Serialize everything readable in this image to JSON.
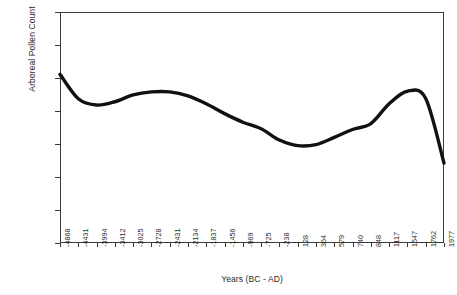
{
  "chart_data": {
    "type": "line",
    "title": "",
    "xlabel": "Years (BC - AD)",
    "ylabel": "Arboreal Pollen Count",
    "ylim": [
      0,
      3500
    ],
    "yticks": [
      0,
      500,
      1000,
      1500,
      2000,
      2500,
      3000,
      3500
    ],
    "grid": false,
    "legend": "none",
    "categories": [
      "-4868",
      "-4431",
      "-3994",
      "-3412",
      "-3025",
      "-2728",
      "-2431",
      "-2134",
      "-1837",
      "-1456",
      "-969",
      "-725",
      "-238",
      "128",
      "364",
      "579",
      "740",
      "848",
      "1117",
      "1547",
      "1762",
      "1977"
    ],
    "values": [
      2555,
      2185,
      2090,
      2140,
      2245,
      2290,
      2290,
      2230,
      2110,
      1960,
      1830,
      1730,
      1560,
      1475,
      1490,
      1600,
      1720,
      1810,
      2110,
      2300,
      2190,
      1210
    ],
    "series": [
      {
        "name": "Arboreal Pollen Count",
        "values": [
          2555,
          2185,
          2090,
          2140,
          2245,
          2290,
          2290,
          2230,
          2110,
          1960,
          1830,
          1730,
          1560,
          1475,
          1490,
          1600,
          1720,
          1810,
          2110,
          2300,
          2190,
          1210
        ],
        "color": "#111111",
        "line_width": 3.4,
        "markers": false,
        "smooth": true
      }
    ]
  },
  "axes": {
    "y_title": "Arboreal Pollen Count",
    "x_title": "Years (BC - AD)",
    "y_tick_labels": [
      "3500",
      "3000",
      "2500",
      "2000",
      "1500",
      "1000",
      "500",
      "0"
    ],
    "x_tick_labels": [
      "-4868",
      "-4431",
      "-3994",
      "-3412",
      "-3025",
      "-2728",
      "-2431",
      "-2134",
      "-1837",
      "-1456",
      "-969",
      "-725",
      "-238",
      "128",
      "364",
      "579",
      "740",
      "848",
      "1117",
      "1547",
      "1762",
      "1977"
    ]
  },
  "style": {
    "background": "#ffffff",
    "axis_color": "#3a3a3a",
    "text_color": "#2b2b2b",
    "line_color": "#111111"
  }
}
